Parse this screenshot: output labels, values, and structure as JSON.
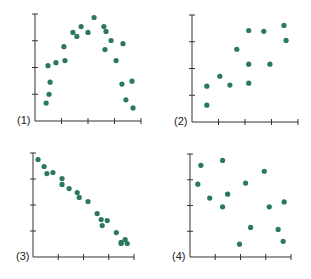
{
  "figure": {
    "colors": {
      "dot": "#2a7a5a",
      "axis": "#333333"
    }
  },
  "chart_data": [
    {
      "type": "scatter",
      "title": "",
      "label": "(1)",
      "xlabel": "",
      "ylabel": "",
      "xlim": [
        0,
        4
      ],
      "ylim": [
        0,
        4
      ],
      "x_ticks": 4,
      "y_ticks": 4,
      "grid": false,
      "points": [
        [
          0.42,
          0.67
        ],
        [
          0.53,
          1.0
        ],
        [
          0.57,
          1.45
        ],
        [
          0.49,
          2.07
        ],
        [
          0.79,
          2.18
        ],
        [
          1.09,
          2.78
        ],
        [
          1.13,
          2.26
        ],
        [
          1.43,
          3.31
        ],
        [
          1.58,
          3.16
        ],
        [
          1.74,
          3.53
        ],
        [
          2.0,
          3.31
        ],
        [
          2.23,
          3.87
        ],
        [
          2.6,
          3.53
        ],
        [
          2.68,
          3.35
        ],
        [
          2.64,
          2.67
        ],
        [
          2.87,
          3.01
        ],
        [
          3.06,
          2.26
        ],
        [
          3.32,
          2.89
        ],
        [
          3.28,
          1.38
        ],
        [
          3.66,
          1.49
        ],
        [
          3.43,
          0.79
        ],
        [
          3.7,
          0.49
        ]
      ]
    },
    {
      "type": "scatter",
      "title": "",
      "label": "(2)",
      "xlabel": "",
      "ylabel": "",
      "xlim": [
        0,
        4
      ],
      "ylim": [
        0,
        4
      ],
      "x_ticks": 4,
      "y_ticks": 4,
      "grid": false,
      "points": [
        [
          0.56,
          0.63
        ],
        [
          0.56,
          1.34
        ],
        [
          1.05,
          1.71
        ],
        [
          1.43,
          1.38
        ],
        [
          1.69,
          2.72
        ],
        [
          2.14,
          3.42
        ],
        [
          2.14,
          2.16
        ],
        [
          2.14,
          1.45
        ],
        [
          2.71,
          3.39
        ],
        [
          2.94,
          2.16
        ],
        [
          3.47,
          3.61
        ],
        [
          3.55,
          3.05
        ]
      ]
    },
    {
      "type": "scatter",
      "title": "",
      "label": "(3)",
      "xlabel": "",
      "ylabel": "",
      "xlim": [
        0,
        4
      ],
      "ylim": [
        0,
        4
      ],
      "x_ticks": 4,
      "y_ticks": 4,
      "grid": false,
      "points": [
        [
          0.2,
          3.75
        ],
        [
          0.44,
          3.48
        ],
        [
          0.55,
          3.21
        ],
        [
          0.79,
          3.25
        ],
        [
          1.15,
          3.02
        ],
        [
          1.15,
          2.79
        ],
        [
          1.43,
          2.63
        ],
        [
          1.75,
          2.48
        ],
        [
          1.83,
          2.29
        ],
        [
          2.18,
          2.13
        ],
        [
          2.54,
          1.67
        ],
        [
          2.7,
          1.44
        ],
        [
          2.74,
          1.21
        ],
        [
          2.94,
          1.4
        ],
        [
          3.3,
          0.94
        ],
        [
          3.49,
          0.52
        ],
        [
          3.65,
          0.67
        ],
        [
          3.73,
          0.52
        ],
        [
          3.49,
          0.56
        ]
      ]
    },
    {
      "type": "scatter",
      "title": "",
      "label": "(4)",
      "xlabel": "",
      "ylabel": "",
      "xlim": [
        0,
        4
      ],
      "ylim": [
        0,
        4
      ],
      "x_ticks": 4,
      "y_ticks": 4,
      "grid": false,
      "points": [
        [
          0.43,
          3.56
        ],
        [
          1.29,
          3.75
        ],
        [
          0.31,
          2.83
        ],
        [
          0.78,
          2.29
        ],
        [
          1.49,
          2.44
        ],
        [
          1.29,
          1.95
        ],
        [
          2.2,
          2.87
        ],
        [
          2.94,
          3.33
        ],
        [
          2.4,
          1.15
        ],
        [
          3.14,
          1.95
        ],
        [
          1.96,
          0.5
        ],
        [
          3.49,
          1.07
        ],
        [
          3.73,
          2.14
        ],
        [
          3.69,
          0.61
        ]
      ]
    }
  ]
}
